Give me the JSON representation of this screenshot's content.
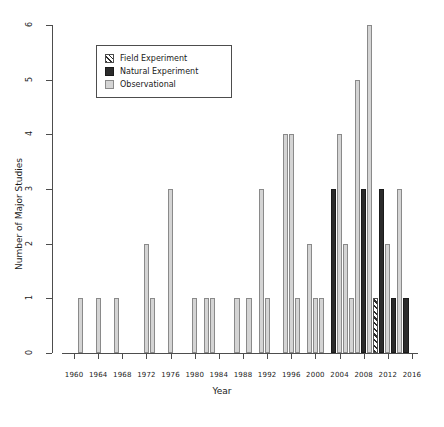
{
  "chart_data": {
    "type": "bar",
    "title": "",
    "xlabel": "Year",
    "ylabel": "Number of Major Studies",
    "xlim": [
      1958,
      2017
    ],
    "ylim": [
      0,
      6
    ],
    "ytick_labels": [
      "0",
      "1",
      "2",
      "3",
      "4",
      "5",
      "6"
    ],
    "ytick_values": [
      0,
      1,
      2,
      3,
      4,
      5,
      6
    ],
    "xtick_labels": [
      "1960",
      "1964",
      "1968",
      "1972",
      "1976",
      "1980",
      "1984",
      "1988",
      "1992",
      "1996",
      "2000",
      "2004",
      "2008",
      "2012",
      "2016"
    ],
    "xtick_values": [
      1960,
      1964,
      1968,
      1972,
      1976,
      1980,
      1984,
      1988,
      1992,
      1996,
      2000,
      2004,
      2008,
      2012,
      2016
    ],
    "grid": false,
    "legend_position": "upper-left-inset",
    "legend": [
      {
        "key": "field",
        "label": "Field Experiment",
        "color": "#2b2b2b",
        "pattern": "diagonal-hatch"
      },
      {
        "key": "natural",
        "label": "Natural Experiment",
        "color": "#2b2b2b",
        "pattern": "solid-black"
      },
      {
        "key": "observational",
        "label": "Observational",
        "color": "#d4d4d4",
        "pattern": "solid-grey"
      }
    ],
    "bars": [
      {
        "year": 1961,
        "value": 1,
        "category": "observational"
      },
      {
        "year": 1964,
        "value": 1,
        "category": "observational"
      },
      {
        "year": 1967,
        "value": 1,
        "category": "observational"
      },
      {
        "year": 1972,
        "value": 2,
        "category": "observational"
      },
      {
        "year": 1973,
        "value": 1,
        "category": "observational"
      },
      {
        "year": 1976,
        "value": 3,
        "category": "observational"
      },
      {
        "year": 1980,
        "value": 1,
        "category": "observational"
      },
      {
        "year": 1982,
        "value": 1,
        "category": "observational"
      },
      {
        "year": 1983,
        "value": 1,
        "category": "observational"
      },
      {
        "year": 1987,
        "value": 1,
        "category": "observational"
      },
      {
        "year": 1989,
        "value": 1,
        "category": "observational"
      },
      {
        "year": 1991,
        "value": 3,
        "category": "observational"
      },
      {
        "year": 1992,
        "value": 1,
        "category": "observational"
      },
      {
        "year": 1995,
        "value": 4,
        "category": "observational"
      },
      {
        "year": 1996,
        "value": 4,
        "category": "observational"
      },
      {
        "year": 1997,
        "value": 1,
        "category": "observational"
      },
      {
        "year": 1999,
        "value": 2,
        "category": "observational"
      },
      {
        "year": 2000,
        "value": 1,
        "category": "observational"
      },
      {
        "year": 2001,
        "value": 1,
        "category": "observational"
      },
      {
        "year": 2003,
        "value": 3,
        "category": "natural"
      },
      {
        "year": 2004,
        "value": 4,
        "category": "observational"
      },
      {
        "year": 2005,
        "value": 2,
        "category": "observational"
      },
      {
        "year": 2006,
        "value": 1,
        "category": "observational"
      },
      {
        "year": 2007,
        "value": 5,
        "category": "observational"
      },
      {
        "year": 2008,
        "value": 3,
        "category": "natural"
      },
      {
        "year": 2009,
        "value": 6,
        "category": "observational"
      },
      {
        "year": 2010,
        "value": 1,
        "category": "field"
      },
      {
        "year": 2011,
        "value": 3,
        "category": "natural"
      },
      {
        "year": 2012,
        "value": 2,
        "category": "observational"
      },
      {
        "year": 2013,
        "value": 1,
        "category": "natural"
      },
      {
        "year": 2014,
        "value": 3,
        "category": "observational"
      },
      {
        "year": 2015,
        "value": 1,
        "category": "natural"
      }
    ]
  }
}
